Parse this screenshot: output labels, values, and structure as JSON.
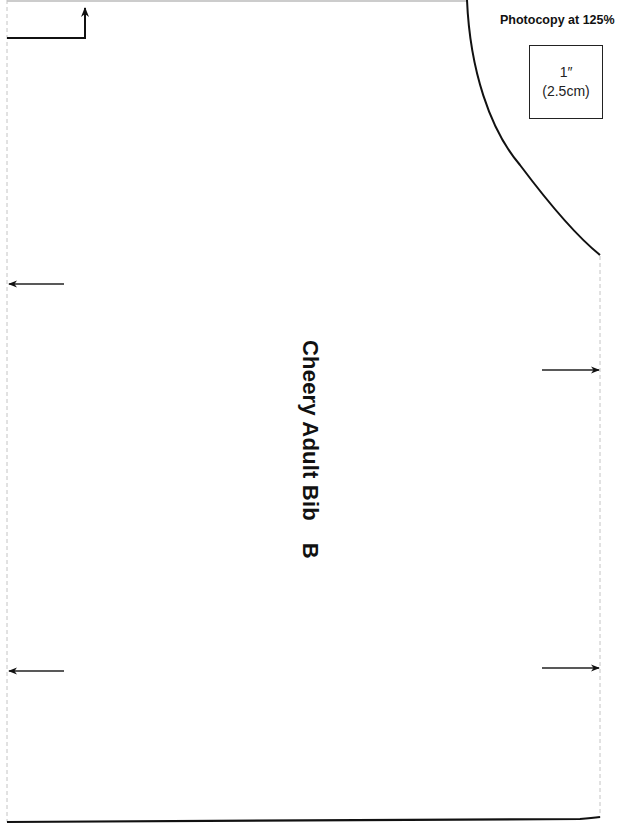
{
  "pattern": {
    "title": "Cheery Adult Bib",
    "piece_letter": "B",
    "instruction": "Photocopy at 125%",
    "scale_reference": {
      "imperial": "1″",
      "metric": "(2.5cm)"
    },
    "grainline_arrows": [
      {
        "side": "left",
        "direction": "left",
        "y": 284
      },
      {
        "side": "left",
        "direction": "left",
        "y": 671
      },
      {
        "side": "right",
        "direction": "right",
        "y": 370
      },
      {
        "side": "right",
        "direction": "right",
        "y": 668
      }
    ],
    "colors": {
      "line": "#111111",
      "fold_line": "#bdbdbd",
      "background": "#ffffff"
    }
  }
}
